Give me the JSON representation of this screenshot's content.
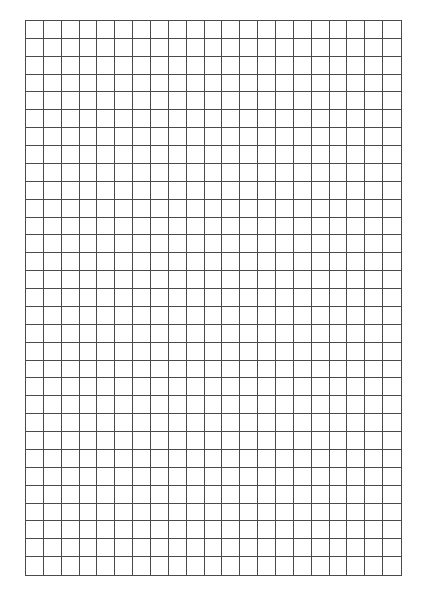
{
  "page": {
    "type": "graph-paper",
    "background": "#ffffff",
    "line_color": "#4a4a4a"
  },
  "grid": {
    "columns": 21,
    "rows": 31,
    "left": 25,
    "top": 20,
    "width": 377,
    "height": 556
  }
}
